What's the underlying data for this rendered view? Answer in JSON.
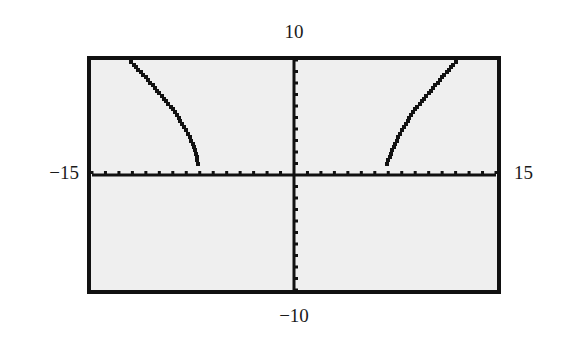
{
  "chart_data": {
    "type": "line",
    "title": "",
    "xlabel": "",
    "ylabel": "",
    "xlim": [
      -15,
      15
    ],
    "ylim": [
      -10,
      10
    ],
    "xscale": 1,
    "yscale": 1,
    "grid": false,
    "legend": null,
    "window_labels": {
      "xmin": "−15",
      "xmax": "15",
      "ymin": "−10",
      "ymax": "10"
    },
    "series": [
      {
        "name": "left branch",
        "x": [
          -12.1,
          -11,
          -10,
          -9,
          -8,
          -7.5,
          -7.1
        ],
        "y": [
          9.8,
          8.5,
          7.1,
          5.7,
          3.9,
          2.7,
          1.0
        ]
      },
      {
        "name": "right branch",
        "x": [
          6.9,
          7.5,
          8,
          9,
          10,
          11,
          12
        ],
        "y": [
          1.0,
          2.7,
          3.9,
          5.7,
          7.1,
          8.5,
          9.8
        ]
      }
    ],
    "background_color": "#efefef",
    "frame_color": "#111111",
    "plot_color": "#111111"
  }
}
